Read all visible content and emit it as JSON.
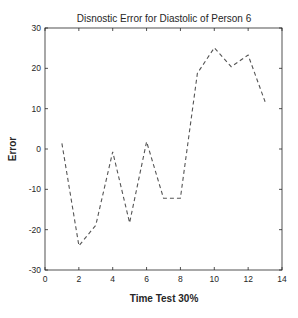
{
  "chart_data": {
    "type": "line",
    "title": "Disnostic Error for Diastolic of Person 6",
    "xlabel": "Time Test 30%",
    "ylabel": "Error",
    "xlim": [
      0,
      14
    ],
    "ylim": [
      -30,
      30
    ],
    "xticks": [
      0,
      2,
      4,
      6,
      8,
      10,
      12,
      14
    ],
    "yticks": [
      -30,
      -20,
      -10,
      0,
      10,
      20,
      30
    ],
    "grid": false,
    "legend": null,
    "series": [
      {
        "name": "Error",
        "style": "dashed",
        "color": "#555555",
        "x": [
          1,
          2,
          3,
          4,
          5,
          6,
          7,
          8,
          9,
          10,
          11,
          12,
          13
        ],
        "values": [
          1.4,
          -24.0,
          -18.9,
          -0.7,
          -18.3,
          1.8,
          -12.2,
          -12.2,
          18.8,
          25.1,
          20.4,
          23.3,
          11.7
        ]
      }
    ]
  }
}
